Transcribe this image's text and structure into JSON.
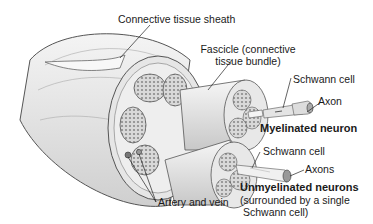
{
  "diagram": {
    "labels": {
      "sheath": "Connective tissue sheath",
      "fascicle_line1": "Fascicle (connective",
      "fascicle_line2": "tissue bundle)",
      "schwann_cell_myelinated": "Schwann cell",
      "axon": "Axon",
      "myelinated_neuron": "Myelinated neuron",
      "schwann_cell_unmyelinated": "Schwann cell",
      "axons": "Axons",
      "unmyelinated_neurons": "Unmyelinated neurons",
      "unmyelinated_note_line1": "(surrounded by a single",
      "unmyelinated_note_line2": "Schwann cell)",
      "artery_vein": "Artery and vein"
    },
    "colors": {
      "background": "#ffffff",
      "line": "#333333",
      "tissue_light": "#ececec",
      "tissue_mid": "#cfcfcf",
      "tissue_dark": "#9a9a9a",
      "text": "#1a1a1a"
    }
  }
}
